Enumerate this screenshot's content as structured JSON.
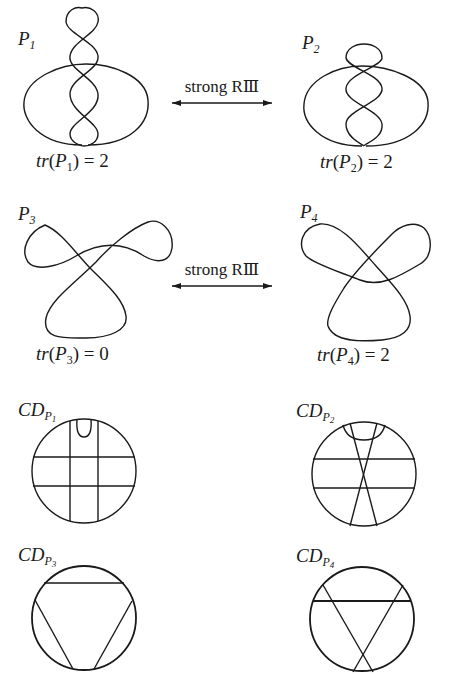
{
  "figure": {
    "rows": [
      {
        "left": {
          "name": "P",
          "index": "1",
          "trace_label": "tr",
          "trace_arg": "P",
          "trace_index": "1",
          "trace_value": "2"
        },
        "move_label": "strong RⅢ",
        "right": {
          "name": "P",
          "index": "2",
          "trace_label": "tr",
          "trace_arg": "P",
          "trace_index": "2",
          "trace_value": "2"
        }
      },
      {
        "left": {
          "name": "P",
          "index": "3",
          "trace_label": "tr",
          "trace_arg": "P",
          "trace_index": "3",
          "trace_value": "0"
        },
        "move_label": "strong RⅢ",
        "right": {
          "name": "P",
          "index": "4",
          "trace_label": "tr",
          "trace_arg": "P",
          "trace_index": "4",
          "trace_value": "2"
        }
      }
    ],
    "chord_diagrams": [
      {
        "name": "CD",
        "sub": "P",
        "subsub": "1"
      },
      {
        "name": "CD",
        "sub": "P",
        "subsub": "2"
      },
      {
        "name": "CD",
        "sub": "P",
        "subsub": "3"
      },
      {
        "name": "CD",
        "sub": "P",
        "subsub": "4"
      }
    ],
    "arrow_icon": "double-headed-arrow",
    "line_color": "#1a1a1a"
  }
}
